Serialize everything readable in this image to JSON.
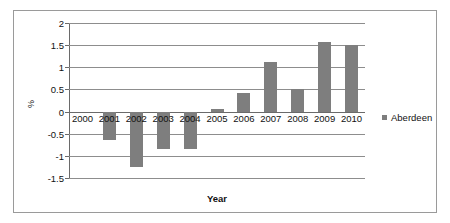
{
  "chart_data": {
    "type": "bar",
    "title": "",
    "xlabel": "Year",
    "ylabel": "%",
    "categories": [
      "2000",
      "2001",
      "2002",
      "2003",
      "2004",
      "2005",
      "2006",
      "2007",
      "2008",
      "2009",
      "2010"
    ],
    "series": [
      {
        "name": "Aberdeen",
        "values": [
          0,
          -0.65,
          -1.25,
          -0.85,
          -0.85,
          0.06,
          0.43,
          1.12,
          0.51,
          1.58,
          1.5
        ]
      }
    ],
    "ylim": [
      -1.5,
      2
    ],
    "ytick_labels": [
      "2",
      "1.5",
      "1",
      "0.5",
      "0",
      "-0.5",
      "-1",
      "-1.5"
    ],
    "ytick_values": [
      2,
      1.5,
      1,
      0.5,
      0,
      -0.5,
      -1,
      -1.5
    ],
    "grid": true,
    "legend_position": "right",
    "bar_color": "#7e7e7e",
    "axis_color": "#6a6a6a",
    "grid_color": "#8d8d8d",
    "background": "#ffffff"
  },
  "legend": {
    "entries": [
      {
        "label": "Aberdeen",
        "color": "#7e7e7e"
      }
    ]
  }
}
